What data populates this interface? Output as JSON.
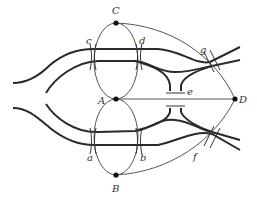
{
  "diagram": {
    "title": "",
    "nodes": [
      {
        "id": "A",
        "label": "A",
        "x": 116,
        "y": 99
      },
      {
        "id": "B",
        "label": "B",
        "x": 116,
        "y": 175
      },
      {
        "id": "C",
        "label": "C",
        "x": 116,
        "y": 23
      },
      {
        "id": "D",
        "label": "D",
        "x": 235,
        "y": 99
      }
    ],
    "bridges": [
      {
        "id": "a",
        "label": "a"
      },
      {
        "id": "b",
        "label": "b"
      },
      {
        "id": "c",
        "label": "c"
      },
      {
        "id": "d",
        "label": "d"
      },
      {
        "id": "e",
        "label": "e"
      },
      {
        "id": "f",
        "label": "f"
      },
      {
        "id": "g",
        "label": "g"
      }
    ],
    "colors": {
      "river": "#2a2a2a",
      "edge": "#555555",
      "node": "#111111"
    }
  }
}
